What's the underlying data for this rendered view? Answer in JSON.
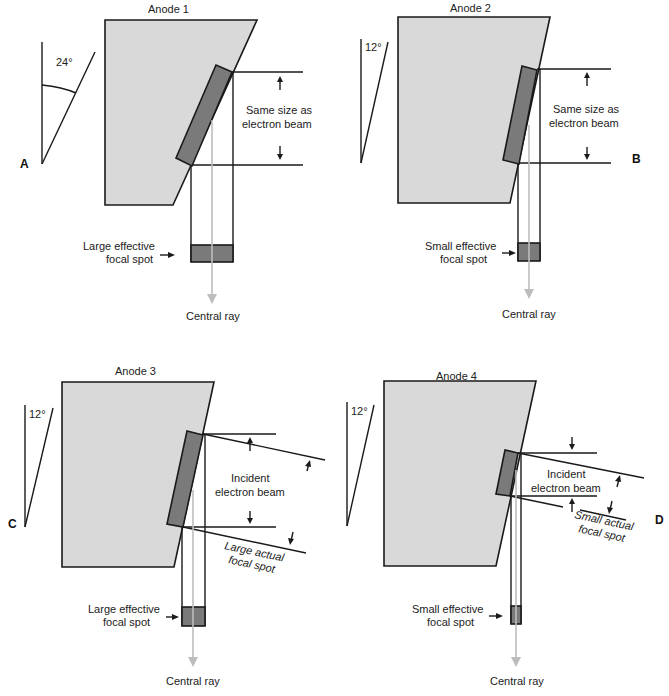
{
  "figure": {
    "panels": [
      {
        "letter": "A",
        "anode_title": "Anode 1",
        "angle_label": "24°",
        "beam_label_line1": "Same size as",
        "beam_label_line2": "electron beam",
        "effective_label_line1": "Large effective",
        "effective_label_line2": "focal spot",
        "ray_label": "Central ray"
      },
      {
        "letter": "B",
        "anode_title": "Anode 2",
        "angle_label": "12°",
        "beam_label_line1": "Same size as",
        "beam_label_line2": "electron beam",
        "effective_label_line1": "Small effective",
        "effective_label_line2": "focal spot",
        "ray_label": "Central ray"
      },
      {
        "letter": "C",
        "anode_title": "Anode 3",
        "angle_label": "12°",
        "beam_label_line1": "Incident",
        "beam_label_line2": "electron beam",
        "actual_label_line1": "Large actual",
        "actual_label_line2": "focal spot",
        "effective_label_line1": "Large effective",
        "effective_label_line2": "focal spot",
        "ray_label": "Central ray"
      },
      {
        "letter": "D",
        "anode_title": "Anode 4",
        "angle_label": "12°",
        "beam_label_line1": "Incident",
        "beam_label_line2": "electron beam",
        "actual_label_line1": "Small actual",
        "actual_label_line2": "focal spot",
        "effective_label_line1": "Small effective",
        "effective_label_line2": "focal spot",
        "ray_label": "Central ray"
      }
    ],
    "colors": {
      "anode_fill": "#d9d9d9",
      "target_fill": "#7a7a7a",
      "central_ray": "#bdbdbd",
      "line": "#1a1a1a"
    }
  }
}
